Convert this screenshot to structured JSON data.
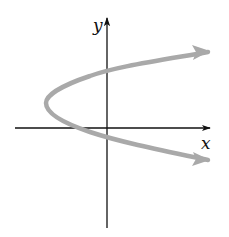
{
  "diagram": {
    "type": "graph-sketch",
    "x_axis_label": "x",
    "y_axis_label": "y",
    "curve_color": "#a9a9a9",
    "axis_color": "#111111",
    "curve": {
      "shape": "parabola",
      "opens": "right",
      "arrows_on_both_ends": true
    }
  }
}
